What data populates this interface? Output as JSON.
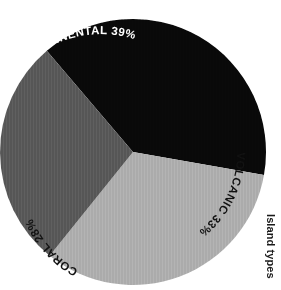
{
  "caption": {
    "text": "Island types"
  },
  "chart_data": {
    "type": "pie",
    "title": "Island types",
    "xlabel": "",
    "ylabel": "",
    "categories": [
      "CONTINENTAL",
      "VOLCANIC",
      "CORAL"
    ],
    "values": [
      39,
      33,
      28
    ],
    "value_suffix": "%",
    "labels": [
      "CONTINENTAL 39%",
      "VOLCANIC 33%",
      "CORAL 28%"
    ],
    "colors": [
      "#090909",
      "#ABABAB",
      "#565656"
    ],
    "label_colors": [
      "#ffffff",
      "#111111",
      "#111111"
    ],
    "legend": "none",
    "grid": false,
    "slices": [
      {
        "name": "CONTINENTAL",
        "value": 39,
        "label": "CONTINENTAL 39%",
        "color": "#090909",
        "label_color": "#ffffff"
      },
      {
        "name": "VOLCANIC",
        "value": 33,
        "label": "VOLCANIC 33%",
        "color": "#ABABAB",
        "label_color": "#111111"
      },
      {
        "name": "CORAL",
        "value": 28,
        "label": "CORAL 28%",
        "color": "#565656",
        "label_color": "#111111"
      }
    ],
    "total": 100
  },
  "labels": {
    "continental": "CONTINENTAL 39%",
    "volcanic": "VOLCANIC 33%",
    "coral": "CORAL 28%"
  },
  "colors": {
    "continental": "#090909",
    "volcanic": "#ABABAB",
    "coral": "#565656",
    "background": "#ffffff"
  }
}
